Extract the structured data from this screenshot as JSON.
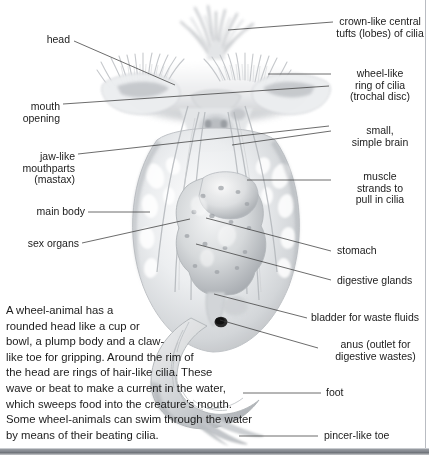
{
  "figure": {
    "style": "grayscale airbrush scientific illustration with leader-line callouts"
  },
  "labels_left": [
    {
      "name": "head",
      "lines": [
        "head"
      ]
    },
    {
      "name": "mouth-opening",
      "lines": [
        "mouth",
        "opening"
      ]
    },
    {
      "name": "jaw-like-mouthparts",
      "lines": [
        "jaw-like",
        "mouthparts",
        "(mastax)"
      ]
    },
    {
      "name": "main-body",
      "lines": [
        "main body"
      ]
    },
    {
      "name": "sex-organs",
      "lines": [
        "sex organs"
      ]
    }
  ],
  "labels_right": [
    {
      "name": "crown-like-tufts",
      "lines": [
        "crown-like central",
        "tufts (lobes) of cilia"
      ]
    },
    {
      "name": "wheel-like-ring-of-cilia",
      "lines": [
        "wheel-like",
        "ring of cilia",
        "(trochal disc)"
      ]
    },
    {
      "name": "simple-brain",
      "lines": [
        "small,",
        "simple brain"
      ]
    },
    {
      "name": "muscle-strands",
      "lines": [
        "muscle",
        "strands to",
        "pull in cilia"
      ]
    },
    {
      "name": "stomach",
      "lines": [
        "stomach"
      ]
    },
    {
      "name": "digestive-glands",
      "lines": [
        "digestive glands"
      ]
    },
    {
      "name": "bladder",
      "lines": [
        "bladder for waste fluids"
      ]
    },
    {
      "name": "anus",
      "lines": [
        "anus (outlet for",
        "digestive wastes)"
      ]
    },
    {
      "name": "foot",
      "lines": [
        "foot"
      ]
    },
    {
      "name": "pincer-like-toe",
      "lines": [
        "pincer-like toe"
      ]
    }
  ],
  "caption": {
    "lines": [
      "A wheel-animal has a",
      "rounded head like a cup or",
      "bowl, a plump body and a claw-",
      "like toe for gripping. Around the rim of",
      "the head are rings of hair-like cilia. These",
      "wave or beat to make a current in the water,",
      "which sweeps food into the creature’s mouth.",
      "Some wheel-animals can swim through the water",
      "by means of their beating cilia."
    ]
  },
  "colors": {
    "text": "#1b1b1b",
    "leader_line": "#3a3a3a",
    "border": "#b9bcc2",
    "background": "#ffffff",
    "art_light": "#f2f3f4",
    "art_mid": "#c6c9cc",
    "art_dark": "#8f9398"
  }
}
